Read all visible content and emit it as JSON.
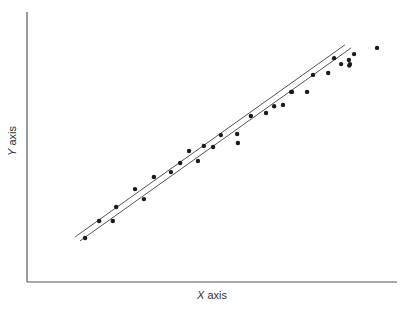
{
  "chart_data": {
    "type": "scatter",
    "title": "",
    "xlabel": "X axis",
    "ylabel": "Y axis",
    "xlim": [
      0,
      100
    ],
    "ylim": [
      0,
      100
    ],
    "grid": false,
    "legend": null,
    "ticks": false,
    "series": [
      {
        "name": "points",
        "kind": "scatter",
        "x": [
          15.7,
          19.5,
          23.2,
          24.1,
          29.2,
          31.6,
          34.3,
          38.9,
          41.4,
          43.8,
          46.2,
          47.8,
          50.3,
          52.4,
          57.0,
          56.8,
          60.5,
          64.6,
          66.8,
          69.2,
          71.6,
          71.4,
          75.7,
          77.3,
          81.4,
          83.0,
          84.9,
          87.0,
          87.1,
          88.4,
          87.3,
          94.6
        ],
        "y": [
          16.3,
          22.6,
          22.6,
          27.8,
          34.4,
          30.7,
          38.9,
          40.7,
          44.1,
          48.5,
          44.8,
          50.4,
          50.0,
          54.4,
          51.5,
          54.8,
          61.5,
          62.6,
          65.1,
          65.6,
          70.4,
          70.4,
          70.4,
          76.7,
          77.4,
          82.9,
          80.7,
          82.2,
          80.2,
          84.4,
          80.7,
          86.7
        ]
      },
      {
        "name": "line-1",
        "kind": "line",
        "x": [
          13.0,
          85.9
        ],
        "y": [
          16.7,
          87.8
        ]
      },
      {
        "name": "line-2",
        "kind": "line",
        "x": [
          14.3,
          87.6
        ],
        "y": [
          15.2,
          86.7
        ]
      }
    ]
  },
  "render": {
    "plot": {
      "x0": 27,
      "y0": 282,
      "x1": 397,
      "y1": 12
    },
    "axis_color": "#555555",
    "point_color": "#1a1a1a",
    "line_color": "#555555"
  }
}
